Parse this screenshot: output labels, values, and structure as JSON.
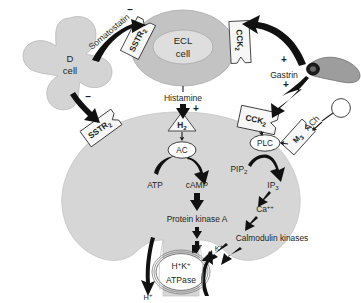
{
  "diagram": {
    "colors": {
      "cell_fill": "#d4d4d4",
      "ecl_fill": "#c3c3c3",
      "parietal_fill": "#d6d6d6",
      "receptor_fill": "#f7f7f7",
      "gcell_fill": "#9d9d9d",
      "ink": "#231f20"
    }
  },
  "cells": {
    "d_cell": {
      "name": "D",
      "subtitle": "cell"
    },
    "ecl_cell": {
      "name": "ECL",
      "subtitle": "cell"
    },
    "g_cell": {
      "label": ""
    },
    "parietal_cell": {
      "label": ""
    }
  },
  "receptors": {
    "sstr2_ecl": {
      "base": "SSTR",
      "sub": "2"
    },
    "sstr2_parietal": {
      "base": "SSTR",
      "sub": "2"
    },
    "cck2_ecl": {
      "base": "CCK",
      "sub": "2"
    },
    "cck2_parietal": {
      "base": "CCK",
      "sub": "2"
    },
    "h2": {
      "base": "H",
      "sub": "2"
    },
    "m3": {
      "base": "M",
      "sub": "3"
    }
  },
  "mediators": {
    "somatostatin": "Somatostatin",
    "histamine": "Histamine",
    "gastrin": "Gastrin",
    "ach": {
      "base": "ACh"
    }
  },
  "enzymes": {
    "ac": "AC",
    "plc": "PLC"
  },
  "second_messengers": {
    "atp": "ATP",
    "camp": "cAMP",
    "pip2": {
      "base": "PIP",
      "sub": "2"
    },
    "ip3": {
      "base": "IP",
      "sub": "3"
    },
    "calcium": {
      "base": "Ca",
      "sup": "++"
    },
    "protein_kinase_a": "Protein kinase A",
    "calmodulin_kinases": "Calmodulin kinases"
  },
  "pump": {
    "line1": {
      "h": "H",
      "h_sup": "+",
      "k": "K",
      "k_sup": "+"
    },
    "line2": "ATPase"
  },
  "ions": {
    "proton_out": {
      "base": "H",
      "sup": "+"
    },
    "potassium_in": {
      "base": "K",
      "sup": "+"
    }
  },
  "signs": {
    "minus_somatostatin_ecl": "–",
    "minus_somatostatin_parietal": "–",
    "plus_histamine": "+",
    "plus_gastrin_ecl": "+",
    "plus_gastrin_parietal": "+"
  }
}
